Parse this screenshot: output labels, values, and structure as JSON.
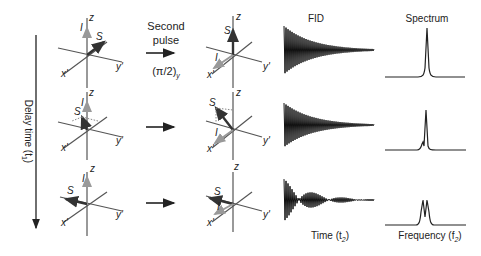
{
  "pulse": {
    "line1": "Second",
    "line2": "pulse",
    "label": "(π/2)",
    "subscript": "y"
  },
  "delay_axis": {
    "label": "Delay time (t",
    "subscript": "1",
    "suffix": ")"
  },
  "headers": {
    "fid": "FID",
    "spectrum": "Spectrum"
  },
  "footers": {
    "time": "Time (t",
    "time_sub": "2",
    "freq": "Frequency (f",
    "freq_sub": "2",
    "close": ")"
  },
  "axis_labels": {
    "z": "z",
    "x": "x'",
    "y": "y'",
    "I": "I",
    "S": "S"
  },
  "rows": [
    {
      "name": "row-1",
      "spectrum": "single-peak"
    },
    {
      "name": "row-2",
      "spectrum": "peak-with-small-shoulder"
    },
    {
      "name": "row-3",
      "spectrum": "doublet"
    }
  ],
  "colors": {
    "ink": "#222222",
    "axis": "#555555",
    "vector_I": "#999999",
    "vector_S": "#333333"
  }
}
